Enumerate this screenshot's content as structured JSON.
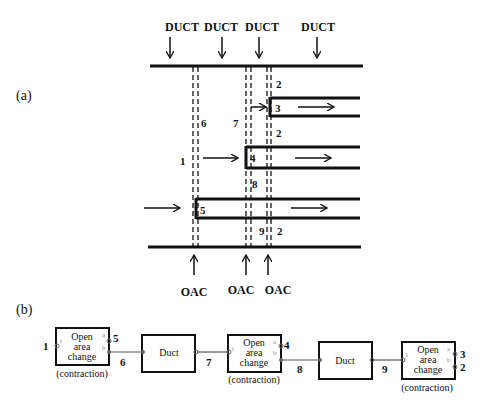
{
  "panel_a": {
    "label": "(a)",
    "duct_labels": [
      "DUCT",
      "DUCT",
      "DUCT",
      "DUCT"
    ],
    "oac_labels": [
      "OAC",
      "OAC",
      "OAC"
    ],
    "node_numbers": {
      "n1": "1",
      "n2_top": "2",
      "n2_mid": "2",
      "n2_bot": "2",
      "n3": "3",
      "n4": "4",
      "n5": "5",
      "n6": "6",
      "n7": "7",
      "n8": "8",
      "n9": "9"
    }
  },
  "panel_b": {
    "label": "(b)",
    "blocks": [
      {
        "type": "open-area-change",
        "lines": [
          "Open",
          "area",
          "change"
        ],
        "caption": "(contraction)",
        "port_in": "i",
        "port_out_a": "a",
        "port_out_b": "b"
      },
      {
        "type": "duct",
        "label": "Duct"
      },
      {
        "type": "open-area-change",
        "lines": [
          "Open",
          "area",
          "change"
        ],
        "caption": "(contraction)",
        "port_in": "i",
        "port_out_a": "a",
        "port_out_b": "b"
      },
      {
        "type": "duct",
        "label": "Duct"
      },
      {
        "type": "open-area-change",
        "lines": [
          "Open",
          "area",
          "change"
        ],
        "caption": "(contraction)",
        "port_in": "i",
        "port_out_a": "a",
        "port_out_b": "b"
      }
    ],
    "node_numbers": {
      "n1": "1",
      "n5": "5",
      "n6": "6",
      "n7": "7",
      "n4": "4",
      "n8": "8",
      "n9": "9",
      "n3": "3",
      "n2": "2"
    }
  },
  "colors": {
    "line": "#111111",
    "port": "#888888",
    "background": "#ffffff"
  }
}
